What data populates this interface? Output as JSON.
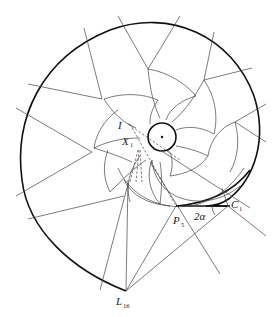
{
  "figure": {
    "type": "geometric construction"
  },
  "labels": {
    "I": {
      "main": "I",
      "sub": ""
    },
    "X1": {
      "main": "X",
      "sub": "1"
    },
    "P5": {
      "main": "P",
      "sub": "5"
    },
    "C1": {
      "main": "C",
      "sub": "1"
    },
    "L16": {
      "main": "L",
      "sub": "16"
    },
    "angle": {
      "main": "2α",
      "sub": ""
    }
  },
  "colors": {
    "stroke": "#444444",
    "heavy": "#111111",
    "background": "#ffffff"
  }
}
